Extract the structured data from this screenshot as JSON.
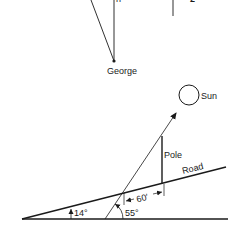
{
  "top_figure": {
    "observer_label": "George",
    "fragment_left": "h",
    "fragment_right": "2"
  },
  "bottom_figure": {
    "sun_label": "Sun",
    "pole_label": "Pole",
    "road_label": "Road",
    "distance_label": "60′",
    "road_angle_label": "14°",
    "sun_angle_label": "55°"
  },
  "colors": {
    "line": "#1a1a1a",
    "background": "#ffffff"
  }
}
